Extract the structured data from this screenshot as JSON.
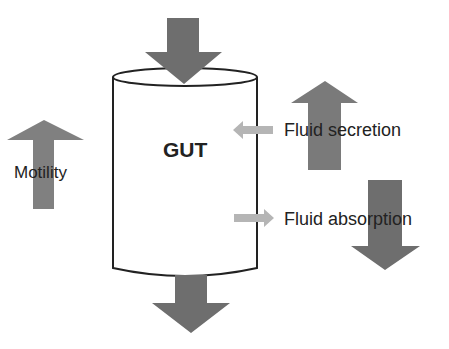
{
  "diagram": {
    "container_label": "GUT",
    "labels": {
      "motility": "Motility",
      "fluid_secretion": "Fluid secretion",
      "fluid_absorption": "Fluid absorption"
    },
    "arrows": [
      {
        "name": "input",
        "direction": "down",
        "color": "#6e6e6e"
      },
      {
        "name": "output",
        "direction": "down",
        "color": "#6e6e6e"
      },
      {
        "name": "motility",
        "direction": "up",
        "color": "#808080"
      },
      {
        "name": "fluid-secretion",
        "direction": "up",
        "color": "#7a7a7a"
      },
      {
        "name": "fluid-absorption",
        "direction": "down",
        "color": "#6e6e6e"
      },
      {
        "name": "secretion-flow",
        "direction": "left",
        "color": "#b5b5b5"
      },
      {
        "name": "absorption-flow",
        "direction": "right",
        "color": "#b5b5b5"
      }
    ]
  }
}
